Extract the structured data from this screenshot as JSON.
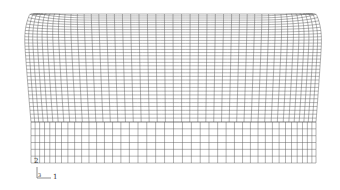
{
  "figure": {
    "type": "finite-element-mesh",
    "line_color": "#555555",
    "background": "#ffffff",
    "upper_body": {
      "top_y": 14,
      "bottom_y": 122,
      "top_left_x": 23,
      "top_right_x": 323,
      "bottom_left_x": 31,
      "bottom_right_x": 316,
      "columns": 44,
      "rows": 34
    },
    "lower_block": {
      "top_y": 122,
      "bottom_y": 163,
      "left_x": 31,
      "right_x": 316,
      "columns": 40,
      "rows": 6
    }
  },
  "triad": {
    "label_y": "2",
    "label_x": "1",
    "label_z": "3"
  }
}
